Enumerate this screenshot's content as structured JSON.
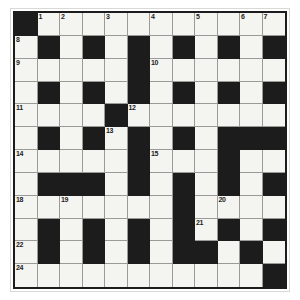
{
  "puzzle": {
    "kind": "crossword-grid",
    "title": "",
    "rows": 12,
    "cols": 12,
    "colors": {
      "block": "#1c1c1c",
      "cell": "#f4f4f0",
      "grid_line": "#9a9a96",
      "page_background": "#ffffff",
      "frame_border": "#d8d8d4",
      "number_text": "#1c1c1c"
    },
    "legend": {
      "block_symbol": "#",
      "open_symbol": "."
    },
    "layout": [
      "#...........",
      ".#.#.#.#.#.#",
      ".....#......",
      ".#.#.#.#.#.#",
      "....#.......",
      ".#.#.#.#.###",
      ".....#...#..",
      ".###.#.#.#.#",
      ".......#....",
      ".#.#.#.#.#.#",
      ".#.#.#.##.#.",
      "...........#"
    ],
    "numbers": [
      {
        "n": 1,
        "row": 0,
        "col": 1
      },
      {
        "n": 2,
        "row": 0,
        "col": 2
      },
      {
        "n": 3,
        "row": 0,
        "col": 4
      },
      {
        "n": 4,
        "row": 0,
        "col": 6
      },
      {
        "n": 5,
        "row": 0,
        "col": 8
      },
      {
        "n": 6,
        "row": 0,
        "col": 10
      },
      {
        "n": 7,
        "row": 0,
        "col": 11
      },
      {
        "n": 8,
        "row": 1,
        "col": 0
      },
      {
        "n": 9,
        "row": 2,
        "col": 0
      },
      {
        "n": 10,
        "row": 2,
        "col": 6
      },
      {
        "n": 11,
        "row": 4,
        "col": 0
      },
      {
        "n": 12,
        "row": 4,
        "col": 5
      },
      {
        "n": 13,
        "row": 5,
        "col": 4
      },
      {
        "n": 14,
        "row": 6,
        "col": 0
      },
      {
        "n": 15,
        "row": 6,
        "col": 6
      },
      {
        "n": 16,
        "row": 6,
        "col": 9
      },
      {
        "n": 17,
        "row": 7,
        "col": 5
      },
      {
        "n": 18,
        "row": 8,
        "col": 0
      },
      {
        "n": 19,
        "row": 8,
        "col": 2
      },
      {
        "n": 20,
        "row": 8,
        "col": 9
      },
      {
        "n": 21,
        "row": 9,
        "col": 8
      },
      {
        "n": 22,
        "row": 10,
        "col": 0
      },
      {
        "n": 23,
        "row": 10,
        "col": 8
      },
      {
        "n": 24,
        "row": 11,
        "col": 0
      }
    ]
  }
}
